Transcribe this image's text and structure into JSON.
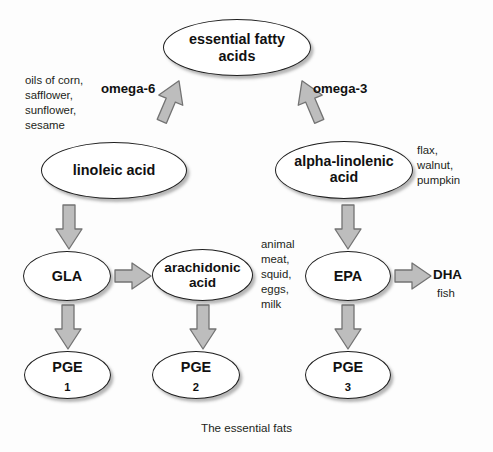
{
  "figure": {
    "caption": "The essential fats",
    "title": "The essential fats"
  },
  "nodes": {
    "essential_fatty_acids": "essential fatty\nacids",
    "linoleic_acid": "linoleic acid",
    "alpha_linolenic_acid": "alpha-linolenic\nacid",
    "gla": "GLA",
    "arachidonic_acid": "arachidonic\nacid",
    "epa": "EPA",
    "pge1_base": "PGE",
    "pge1_sub": "1",
    "pge2_base": "PGE",
    "pge2_sub": "2",
    "pge3_base": "PGE",
    "pge3_sub": "3"
  },
  "edge_labels": {
    "omega_6": "omega-6",
    "omega_3": "omega-3",
    "dha": "DHA"
  },
  "annotations": {
    "omega6_sources": "oils of corn,\nsafflower,\nsunflower,\nsesame",
    "omega3_sources": "flax,\nwalnut,\npumpkin",
    "arachidonic_sources": "animal\nmeat,\nsquid,\neggs,\nmilk",
    "dha_sources": "fish"
  },
  "colors": {
    "node_stroke": "#1f1f1f",
    "node_fill": "#ffffff",
    "arrow_fill": "#b8b8b8",
    "arrow_stroke": "#6e6e6e",
    "text": "#231f20",
    "background": "#fdfdfd"
  }
}
